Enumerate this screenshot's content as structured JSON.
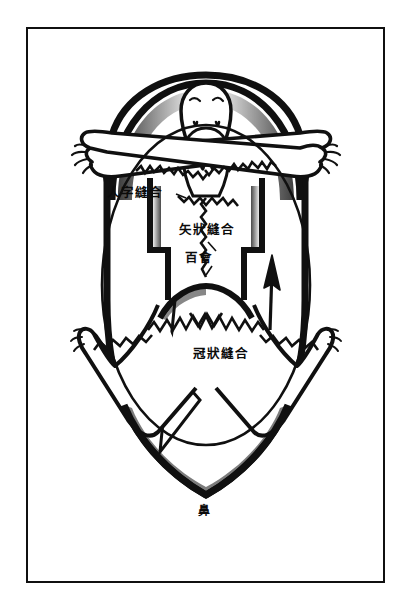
{
  "page": {
    "background_color": "#ffffff",
    "ink_color": "#101010",
    "frame": {
      "present": true,
      "border_color": "#101010"
    }
  },
  "illustration": {
    "name": "skull-sutures-with-human-figures",
    "description": "Top view of a human skull showing cranial sutures, overlaid with stylized human figures with outstretched arms and legs, and an upward arrow",
    "elements": [
      "skull-outline",
      "inner-oval-outline",
      "upper-human-figure",
      "lower-human-figure",
      "arms-outstretched",
      "legs-outstretched",
      "jagged-suture-lines",
      "upward-arrow"
    ]
  },
  "labels": {
    "lambdoid_suture": "人字縫合",
    "sagittal_suture": "矢狀縫合",
    "baihui_point": "百會",
    "coronal_suture": "冠狀縫合",
    "nose": "鼻"
  }
}
